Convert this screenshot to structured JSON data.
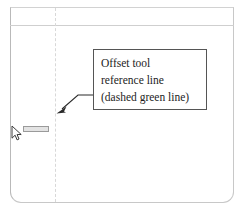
{
  "canvas": {
    "background_color": "#ffffff",
    "frame_color": "#c8c8c8",
    "header_rule_color": "#cfcfcf"
  },
  "reference_line": {
    "name": "offset-tool-reference-line",
    "style": "dashed",
    "described_color": "green",
    "rendered_color": "#d8d8d8"
  },
  "callout": {
    "line1": "Offset tool",
    "line2": "reference line",
    "line3": "(dashed green line)",
    "border_color": "#555555",
    "text_color": "#1d1d1d"
  },
  "leader": {
    "arrow_color": "#2b2b2b"
  },
  "cursor": {
    "type": "arrow-pointer",
    "tooltip_label": ""
  }
}
